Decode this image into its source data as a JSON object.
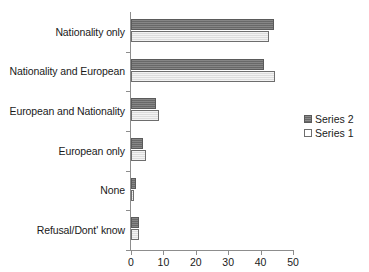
{
  "chart_data": {
    "type": "bar",
    "orientation": "horizontal",
    "title": "",
    "xlabel": "",
    "ylabel": "",
    "categories": [
      "Nationality only",
      "Nationality and European",
      "European and Nationality",
      "European only",
      "None",
      "Refusal/Dont' know"
    ],
    "series": [
      {
        "name": "Series 2",
        "color": "#6f6f6f",
        "values": [
          44.0,
          41.0,
          7.7,
          3.8,
          1.6,
          2.5
        ]
      },
      {
        "name": "Series 1",
        "color": "#e4e4e4",
        "values": [
          42.5,
          44.5,
          8.7,
          4.6,
          0.9,
          2.5
        ]
      }
    ],
    "xlim": [
      0,
      50
    ],
    "xticks": [
      0,
      10,
      20,
      30,
      40,
      50
    ],
    "xtick_labels": [
      "0",
      "10",
      "20",
      "30",
      "40",
      "50"
    ],
    "grid": false,
    "legend_position": "right"
  },
  "legend": {
    "items": [
      {
        "label": "Series 2",
        "swatch": "series-2-swatch"
      },
      {
        "label": "Series 1",
        "swatch": "series-1-swatch"
      }
    ]
  }
}
